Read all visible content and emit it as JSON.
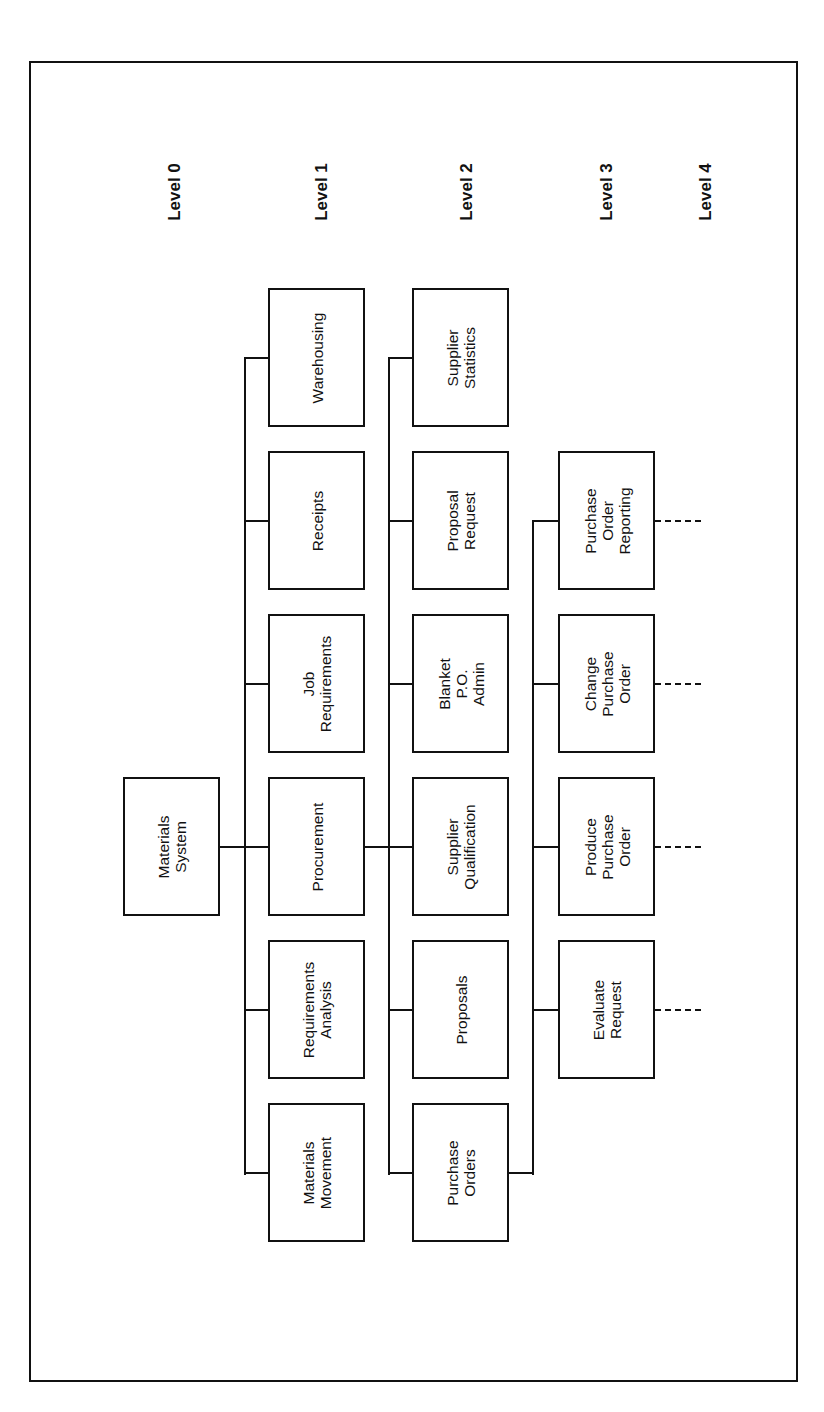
{
  "levels": [
    {
      "label": "Level 0"
    },
    {
      "label": "Level 1"
    },
    {
      "label": "Level 2"
    },
    {
      "label": "Level 3"
    },
    {
      "label": "Level 4"
    }
  ],
  "hierarchy": {
    "root": {
      "label": "Materials System",
      "level": 0
    },
    "level1": [
      {
        "label": "Warehousing"
      },
      {
        "label": "Receipts"
      },
      {
        "label": "Job\nRequirements"
      },
      {
        "label": "Procurement"
      },
      {
        "label": "Requirements\nAnalysis"
      },
      {
        "label": "Materials\nMovement"
      }
    ],
    "level2_parent": "Procurement",
    "level2": [
      {
        "label": "Supplier\nStatistics"
      },
      {
        "label": "Proposal\nRequest"
      },
      {
        "label": "Blanket\nP.O.\nAdmin"
      },
      {
        "label": "Supplier\nQualification"
      },
      {
        "label": "Proposals"
      },
      {
        "label": "Purchase\nOrders"
      }
    ],
    "level3_parent": "Purchase Orders",
    "level3": [
      {
        "label": "Purchase\nOrder\nReporting"
      },
      {
        "label": "Change\nPurchase\nOrder"
      },
      {
        "label": "Produce\nPurchase\nOrder"
      },
      {
        "label": "Evaluate\nRequest"
      }
    ],
    "level4_note": "dashed continuation lines from each Level 3 box"
  },
  "root_label": "Materials\nSystem"
}
